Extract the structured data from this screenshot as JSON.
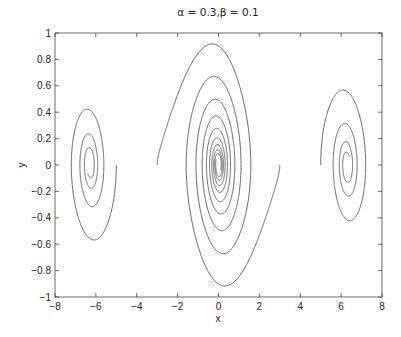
{
  "chart_data": {
    "type": "line",
    "title": "α = 0.3,β = 0.1",
    "xlabel": "x",
    "ylabel": "y",
    "xlim": [
      -8,
      8
    ],
    "ylim": [
      -1,
      1
    ],
    "grid": false,
    "legend": null,
    "xticks": [
      -8,
      -6,
      -4,
      -2,
      0,
      2,
      4,
      6,
      8
    ],
    "xtick_labels": [
      "−8",
      "−6",
      "−4",
      "−2",
      "0",
      "2",
      "4",
      "6",
      "8"
    ],
    "yticks": [
      1,
      0.8,
      0.6,
      0.4,
      0.2,
      0,
      -0.2,
      -0.4,
      -0.6,
      -0.8,
      -1
    ],
    "ytick_labels": [
      "1",
      "0.8",
      "0.6",
      "0.4",
      "0.2",
      "0",
      "−0.2",
      "−0.4",
      "−0.6",
      "−0.8",
      "−1"
    ],
    "model": "damped pendulum phase portrait: x' = y, y' = -alpha*sin(x) - beta*y",
    "alpha": 0.3,
    "beta": 0.1,
    "line_color": "#555555",
    "series": [
      {
        "name": "trajectory from (-3, 0)",
        "x0": -3,
        "y0": 0,
        "t_end": 60,
        "spirals_to": [
          0,
          0
        ],
        "y_min_approx": -0.92
      },
      {
        "name": "trajectory from (3, 0)",
        "x0": 3,
        "y0": 0,
        "t_end": 60,
        "spirals_to": [
          0,
          0
        ],
        "y_max_approx": 0.91
      },
      {
        "name": "trajectory from (-5, 0)",
        "x0": -5,
        "y0": 0,
        "t_end": 40,
        "spirals_to": [
          -6.283,
          0
        ],
        "y_range_approx": [
          -0.56,
          0.43
        ]
      },
      {
        "name": "trajectory from (5, 0)",
        "x0": 5,
        "y0": 0,
        "t_end": 40,
        "spirals_to": [
          6.283,
          0
        ],
        "y_range_approx": [
          -0.42,
          0.57
        ]
      }
    ]
  }
}
